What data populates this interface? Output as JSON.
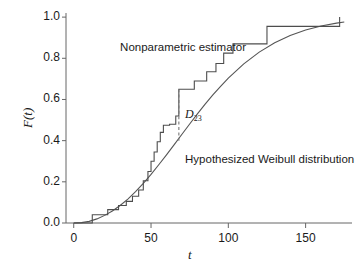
{
  "chart_data": {
    "type": "line",
    "title": "",
    "xlabel": "t",
    "ylabel": "F(t)",
    "xlim": [
      -5,
      180
    ],
    "ylim": [
      0.0,
      1.02
    ],
    "grid": false,
    "legend": "inline-annotations",
    "xticks": [
      0,
      50,
      100,
      150
    ],
    "xtick_labels": [
      "0",
      "50",
      "100",
      "150"
    ],
    "yticks": [
      0.0,
      0.2,
      0.4,
      0.6,
      0.8,
      1.0
    ],
    "ytick_labels": [
      "0.0",
      "0.2",
      "0.4",
      "0.6",
      "0.8",
      "1.0"
    ],
    "annotations": [
      {
        "name": "nonparametric-estimator-label",
        "text": "Nonparametric estimator",
        "x": 30,
        "y": 0.845
      },
      {
        "name": "hypothesized-weibull-label",
        "text": "Hypothesized Weibull distribution",
        "x": 72,
        "y": 0.3
      },
      {
        "name": "d23-label",
        "text": "D",
        "sub": "23",
        "x": 72,
        "y": 0.525
      }
    ],
    "series": [
      {
        "name": "Nonparametric estimator",
        "type": "step",
        "color": "#4d4d4d",
        "x": [
          0,
          12,
          12,
          22,
          22,
          29,
          29,
          34,
          34,
          38,
          38,
          42,
          42,
          45,
          45,
          48,
          48,
          50,
          50,
          52,
          52,
          54,
          54,
          56,
          56,
          58,
          58,
          62,
          62,
          66,
          66,
          68,
          68,
          78,
          78,
          86,
          86,
          92,
          92,
          97,
          97,
          103,
          103,
          125,
          125,
          172,
          172
        ],
        "y": [
          0.0,
          0.0,
          0.04,
          0.04,
          0.065,
          0.065,
          0.085,
          0.085,
          0.105,
          0.105,
          0.13,
          0.13,
          0.16,
          0.16,
          0.205,
          0.205,
          0.25,
          0.25,
          0.3,
          0.3,
          0.345,
          0.345,
          0.395,
          0.395,
          0.44,
          0.44,
          0.475,
          0.475,
          0.48,
          0.48,
          0.52,
          0.52,
          0.65,
          0.65,
          0.69,
          0.69,
          0.735,
          0.735,
          0.775,
          0.775,
          0.825,
          0.825,
          0.87,
          0.87,
          0.955,
          0.955,
          1.0
        ]
      },
      {
        "name": "Hypothesized Weibull distribution",
        "type": "curve",
        "color": "#555555",
        "weibull_scale": 82,
        "weibull_shape": 2.15,
        "x": [
          0,
          5,
          10,
          15,
          20,
          25,
          30,
          35,
          40,
          45,
          50,
          55,
          60,
          65,
          70,
          75,
          80,
          85,
          90,
          95,
          100,
          110,
          120,
          130,
          140,
          150,
          160,
          170,
          175
        ],
        "y": [
          0.0,
          0.002,
          0.008,
          0.02,
          0.037,
          0.058,
          0.085,
          0.116,
          0.152,
          0.192,
          0.236,
          0.283,
          0.331,
          0.381,
          0.431,
          0.481,
          0.53,
          0.577,
          0.622,
          0.664,
          0.704,
          0.773,
          0.83,
          0.875,
          0.911,
          0.937,
          0.957,
          0.971,
          0.976
        ]
      }
    ],
    "reference_line": {
      "name": "D23 distance marker",
      "style": "dashed",
      "x": 68,
      "y_top": 0.65,
      "y_bottom": 0.395,
      "color": "#777777"
    }
  },
  "axes": {
    "axis_color": "#666666",
    "tick_color": "#666666",
    "text_color": "#1a1a1a"
  }
}
